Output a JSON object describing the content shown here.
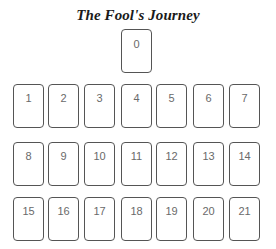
{
  "title": "The Fool's Journey",
  "colors": {
    "border": "#555555",
    "number": "#6a6a6a",
    "title": "#1a1a1a",
    "background": "#ffffff"
  },
  "fool_card": {
    "label": "0"
  },
  "rows": [
    {
      "cards": [
        {
          "label": "1"
        },
        {
          "label": "2"
        },
        {
          "label": "3"
        },
        {
          "label": "4"
        },
        {
          "label": "5"
        },
        {
          "label": "6"
        },
        {
          "label": "7"
        }
      ]
    },
    {
      "cards": [
        {
          "label": "8"
        },
        {
          "label": "9"
        },
        {
          "label": "10"
        },
        {
          "label": "11"
        },
        {
          "label": "12"
        },
        {
          "label": "13"
        },
        {
          "label": "14"
        }
      ]
    },
    {
      "cards": [
        {
          "label": "15"
        },
        {
          "label": "16"
        },
        {
          "label": "17"
        },
        {
          "label": "18"
        },
        {
          "label": "19"
        },
        {
          "label": "20"
        },
        {
          "label": "21"
        }
      ]
    }
  ]
}
